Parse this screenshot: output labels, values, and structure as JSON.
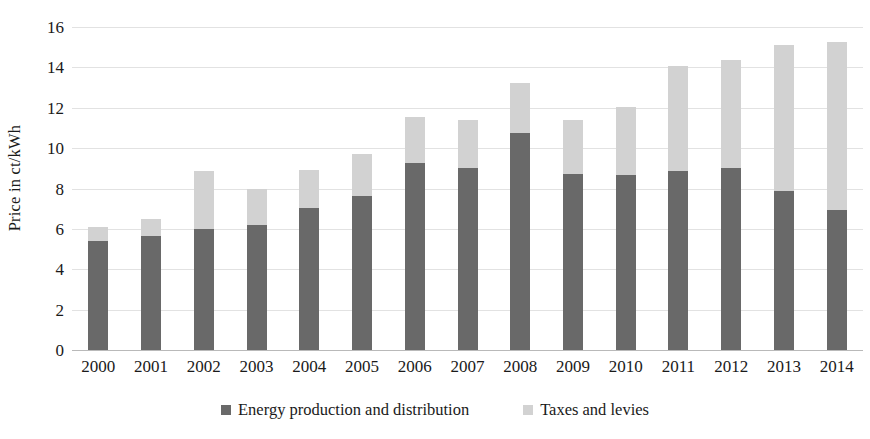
{
  "chart_data": {
    "type": "bar",
    "subtype": "stacked-bar",
    "title": "",
    "xlabel": "",
    "ylabel": "Price in ct/kWh",
    "ylim": [
      0,
      16
    ],
    "ytick_step": 2,
    "yticks": [
      0,
      2,
      4,
      6,
      8,
      10,
      12,
      14,
      16
    ],
    "grid": true,
    "legend_position": "bottom",
    "categories": [
      "2000",
      "2001",
      "2002",
      "2003",
      "2004",
      "2005",
      "2006",
      "2007",
      "2008",
      "2009",
      "2010",
      "2011",
      "2012",
      "2013",
      "2014"
    ],
    "series": [
      {
        "name": "Energy production and distribution",
        "color": "#696969",
        "values": [
          5.4,
          5.65,
          6.0,
          6.2,
          7.05,
          7.65,
          9.25,
          9.0,
          10.75,
          8.7,
          8.65,
          8.85,
          9.0,
          7.9,
          6.95
        ]
      },
      {
        "name": "Taxes and levies",
        "color": "#d2d2d2",
        "values": [
          0.7,
          0.85,
          2.85,
          1.8,
          1.85,
          2.05,
          2.3,
          2.4,
          2.5,
          2.7,
          3.4,
          5.2,
          5.35,
          7.2,
          8.3
        ]
      }
    ],
    "totals": [
      6.1,
      6.5,
      8.85,
      8.0,
      8.9,
      9.7,
      11.55,
      11.4,
      13.25,
      11.4,
      12.05,
      14.05,
      14.35,
      15.1,
      15.25
    ]
  },
  "legend": {
    "items": [
      {
        "label": "Energy production and distribution",
        "color": "#696969"
      },
      {
        "label": "Taxes and levies",
        "color": "#d2d2d2"
      }
    ]
  },
  "colors": {
    "energy": "#696969",
    "taxes": "#d2d2d2",
    "gridline": "#e2e2e2",
    "axis": "#b9b9b9",
    "text": "#1a1a1a",
    "background": "#ffffff"
  }
}
